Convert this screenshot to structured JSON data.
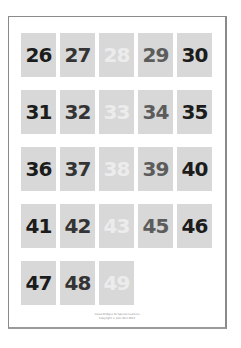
{
  "worksheet": {
    "rows": [
      {
        "tiles": [
          {
            "label": "26",
            "shade": "c1"
          },
          {
            "label": "27",
            "shade": "c2"
          },
          {
            "label": "28",
            "shade": "c3"
          },
          {
            "label": "29",
            "shade": "c4"
          },
          {
            "label": "30",
            "shade": "c5"
          }
        ]
      },
      {
        "tiles": [
          {
            "label": "31",
            "shade": "c1"
          },
          {
            "label": "32",
            "shade": "c2"
          },
          {
            "label": "33",
            "shade": "c3"
          },
          {
            "label": "34",
            "shade": "c4"
          },
          {
            "label": "35",
            "shade": "c5"
          }
        ]
      },
      {
        "tiles": [
          {
            "label": "36",
            "shade": "c1"
          },
          {
            "label": "37",
            "shade": "c2"
          },
          {
            "label": "38",
            "shade": "c3"
          },
          {
            "label": "39",
            "shade": "c4"
          },
          {
            "label": "40",
            "shade": "c5"
          }
        ]
      },
      {
        "tiles": [
          {
            "label": "41",
            "shade": "c1"
          },
          {
            "label": "42",
            "shade": "c2"
          },
          {
            "label": "43",
            "shade": "c3"
          },
          {
            "label": "45",
            "shade": "c4"
          },
          {
            "label": "46",
            "shade": "c5"
          }
        ]
      },
      {
        "tiles": [
          {
            "label": "47",
            "shade": "c1"
          },
          {
            "label": "48",
            "shade": "c2"
          },
          {
            "label": "49",
            "shade": "c3"
          }
        ]
      }
    ],
    "tile_background": "#d8d8d8",
    "text_shades": {
      "c1": "#1c1c1c",
      "c2": "#343434",
      "c3": "#ececec",
      "c4": "#5c5c5c",
      "c5": "#1c1c1c"
    }
  },
  "footer": {
    "line1": "Visual Bridges for Special Learners",
    "line2": "Copyright © Julie Weil 2013"
  }
}
